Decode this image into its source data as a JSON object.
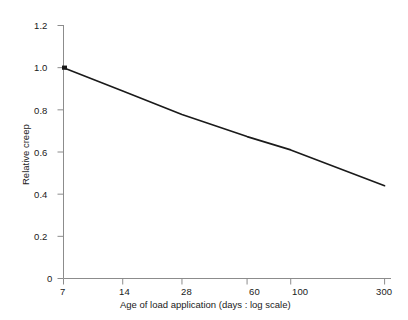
{
  "chart_data": {
    "type": "line",
    "title": "",
    "subtitle": "",
    "xlabel": "Age of load application (days : log scale)",
    "ylabel": "Relative creep",
    "xscale": "log",
    "yscale": "linear",
    "xlim": [
      7,
      320
    ],
    "ylim": [
      0,
      1.2
    ],
    "grid": false,
    "legend": null,
    "x_ticks": [
      7,
      14,
      28,
      60,
      100,
      300
    ],
    "x_tick_labels": [
      "7",
      "14",
      "28",
      "60",
      "100",
      "300"
    ],
    "y_ticks": [
      0,
      0.2,
      0.4,
      0.6,
      0.8,
      1.0,
      1.2
    ],
    "y_tick_labels": [
      "0",
      "0.2",
      "0.4",
      "0.6",
      "0.8",
      "1.0",
      "1.2"
    ],
    "series": [
      {
        "name": "Relative creep",
        "color": "#1a1a1a",
        "linewidth": 1.6,
        "x": [
          7,
          14,
          28,
          60,
          100,
          300
        ],
        "y": [
          1.0,
          0.889,
          0.778,
          0.673,
          0.61,
          0.44
        ]
      }
    ],
    "annotations": []
  },
  "axes": {
    "axis_color": "#8c8c8c",
    "tick_color": "#8c8c8c",
    "line_color": "#1a1a1a",
    "background": "#ffffff",
    "spines": [
      "left",
      "bottom"
    ]
  },
  "labels": {
    "y_axis_title": "Relative creep",
    "x_axis_title": "Age of load application (days : log scale)",
    "y0": "0",
    "y1": "0.2",
    "y2": "0.4",
    "y3": "0.6",
    "y4": "0.8",
    "y5": "1.0",
    "y6": "1.2",
    "x0": "7",
    "x1": "14",
    "x2": "28",
    "x3": "60",
    "x4": "100",
    "x5": "300"
  }
}
